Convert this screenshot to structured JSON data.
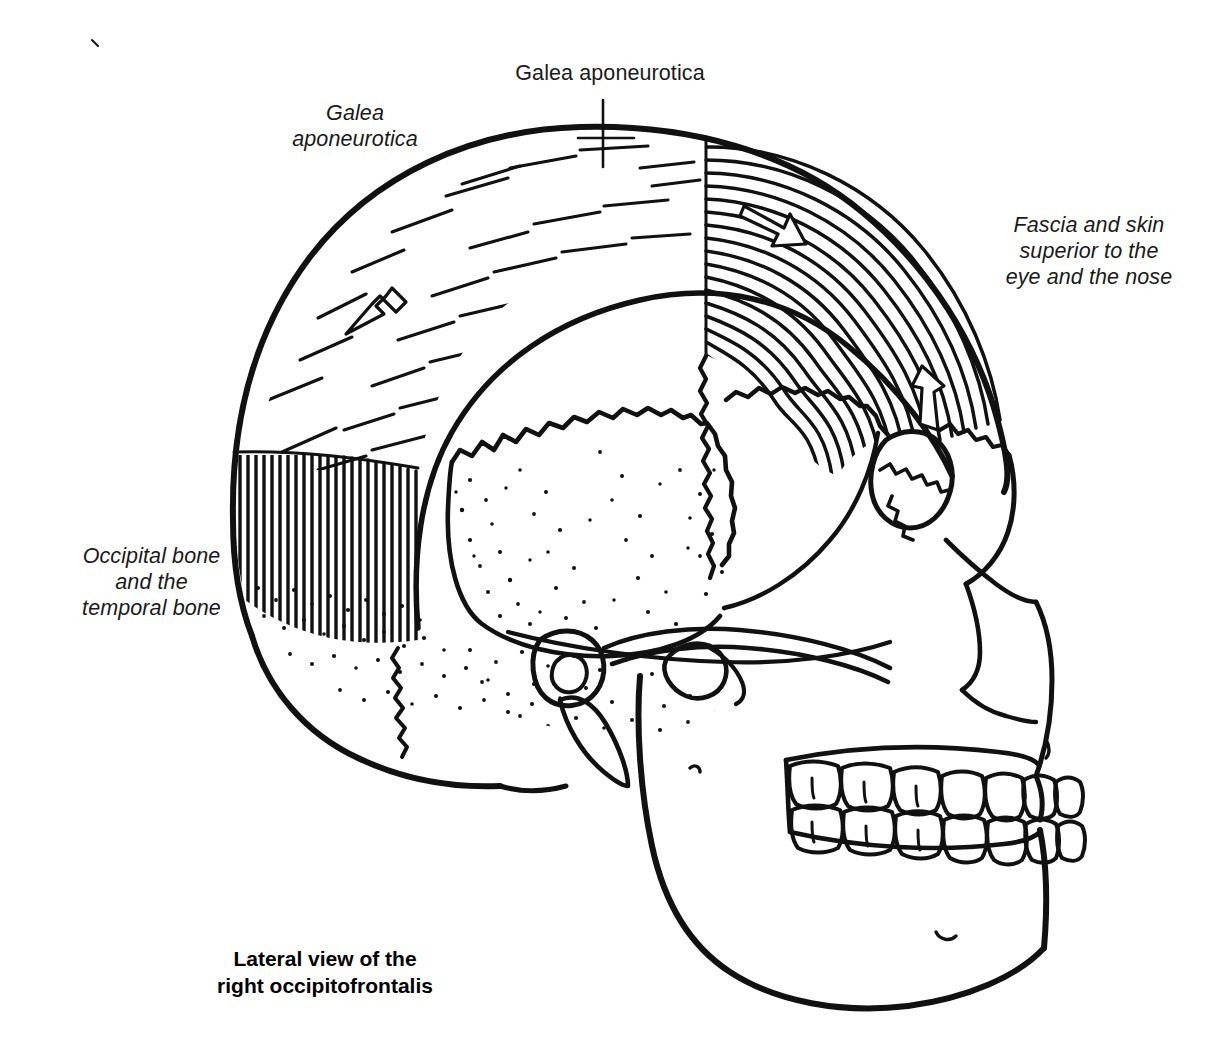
{
  "figure": {
    "title": "Lateral view of the right occipitofrontalis",
    "caption": "Lateral view of the\nright occipitofrontalis",
    "ink_color": "#111111",
    "background_color": "#ffffff"
  },
  "labels": {
    "galea_top": "Galea aponeurotica",
    "galea_left": "Galea\naponeurotica",
    "fascia_skin": "Fascia and skin\nsuperior to the\neye and the nose",
    "occipital_temporal": "Occipital bone\nand the\ntemporal bone"
  },
  "structures": [
    {
      "name": "occipital-belly",
      "texture": "dense-vertical-fibers"
    },
    {
      "name": "galea-aponeurotica",
      "texture": "sparse-dashes"
    },
    {
      "name": "frontal-belly",
      "texture": "dense-curved-fibers"
    },
    {
      "name": "parietal-bone",
      "texture": "stipple"
    },
    {
      "name": "temporal-bone",
      "texture": "stipple"
    },
    {
      "name": "occipital-bone",
      "texture": "stipple"
    },
    {
      "name": "mandible",
      "texture": "outline"
    },
    {
      "name": "maxilla",
      "texture": "outline"
    },
    {
      "name": "orbit",
      "texture": "outline"
    },
    {
      "name": "zygomatic-arch",
      "texture": "outline"
    },
    {
      "name": "teeth-upper",
      "texture": "outline"
    },
    {
      "name": "teeth-lower",
      "texture": "outline"
    }
  ],
  "arrows": [
    {
      "name": "arrow-galea-posterior",
      "x": 378,
      "y": 308,
      "angle": 222,
      "meaning": "pull direction of occipital belly"
    },
    {
      "name": "arrow-frontal-upper",
      "x": 778,
      "y": 230,
      "angle": 135,
      "meaning": "pull direction of frontal belly"
    },
    {
      "name": "arrow-frontal-lower",
      "x": 932,
      "y": 392,
      "angle": 285,
      "meaning": "pull direction toward eyebrow"
    }
  ]
}
